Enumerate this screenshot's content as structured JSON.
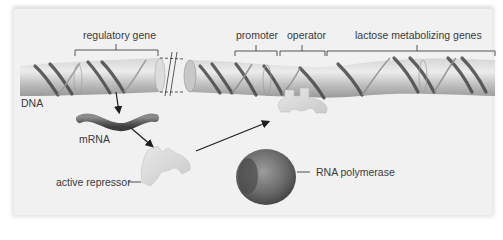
{
  "figure": {
    "type": "lac operon diagram (repressor bound, transcription off)",
    "palette": {
      "background": "#f1f1f1",
      "dna_tube": "#bdbdbd",
      "dna_strand": "#4a4a4a",
      "mrna": "#666666",
      "repressor": "#d9d9d9",
      "polymerase": "#6a6a6a",
      "text": "#3a3a3a"
    }
  },
  "labels": {
    "regulatory_gene": "regulatory gene",
    "promoter": "promoter",
    "operator": "operator",
    "lactose_genes": "lactose metabolizing genes",
    "dna": "DNA",
    "mrna": "mRNA",
    "active_repressor": "active repressor",
    "rna_polymerase": "RNA polymerase"
  }
}
